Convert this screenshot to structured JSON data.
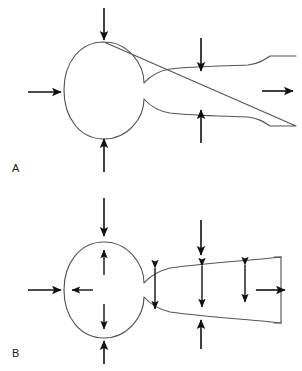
{
  "figure": {
    "background_color": "#ffffff",
    "outline_color": "#555555",
    "arrow_color": "#111111",
    "width": 302,
    "height": 371
  },
  "panels": [
    {
      "id": "A",
      "label": "A",
      "label_x": 12,
      "label_y": 172,
      "description": "Bulb and tapering tube with external compressive force arrows and axial flow arrows",
      "shape": {
        "name": "bulb-and-tube-outline-a",
        "bulb_center_x": 104,
        "bulb_center_y": 90,
        "bulb_radius_x": 40,
        "bulb_radius_y": 48,
        "tube_right_x": 296,
        "tube_top_y": 68,
        "tube_bottom_y": 112
      },
      "arrows": [
        {
          "name": "inflow-arrow-left",
          "kind": "single",
          "direction": "right",
          "x1": 28,
          "y1": 92,
          "x2": 64,
          "y2": 92
        },
        {
          "name": "outflow-arrow-right",
          "kind": "single",
          "direction": "right",
          "x1": 262,
          "y1": 91,
          "x2": 296,
          "y2": 91
        },
        {
          "name": "bulb-top-force-arrow",
          "kind": "single",
          "direction": "down",
          "x1": 104,
          "y1": 8,
          "x2": 104,
          "y2": 43
        },
        {
          "name": "bulb-bottom-force-arrow",
          "kind": "single",
          "direction": "up",
          "x1": 104,
          "y1": 172,
          "x2": 104,
          "y2": 136
        },
        {
          "name": "tube-top-force-arrow",
          "kind": "single",
          "direction": "down",
          "x1": 201,
          "y1": 38,
          "x2": 201,
          "y2": 74
        },
        {
          "name": "tube-bottom-force-arrow",
          "kind": "single",
          "direction": "up",
          "x1": 201,
          "y1": 143,
          "x2": 201,
          "y2": 106
        }
      ]
    },
    {
      "id": "B",
      "label": "B",
      "label_x": 12,
      "label_y": 357,
      "description": "Bulb and tube with external force arrows plus internal radially outward and double-headed distension arrows, closed bracket at outlet",
      "shape": {
        "name": "bulb-and-tube-outline-b",
        "bulb_center_x": 104,
        "bulb_center_y": 290,
        "bulb_radius_x": 40,
        "bulb_radius_y": 48,
        "tube_right_x": 281,
        "tube_top_y": 262,
        "tube_bottom_y": 312
      },
      "arrows": [
        {
          "name": "inflow-arrow-left",
          "kind": "single",
          "direction": "right",
          "x1": 28,
          "y1": 290,
          "x2": 64,
          "y2": 290
        },
        {
          "name": "outflow-arrow-right",
          "kind": "single",
          "direction": "right",
          "x1": 258,
          "y1": 290,
          "x2": 288,
          "y2": 290
        },
        {
          "name": "bulb-top-force-arrow",
          "kind": "single",
          "direction": "down",
          "x1": 104,
          "y1": 198,
          "x2": 104,
          "y2": 238
        },
        {
          "name": "bulb-bottom-force-arrow",
          "kind": "single",
          "direction": "up",
          "x1": 104,
          "y1": 357,
          "x2": 104,
          "y2": 333
        },
        {
          "name": "tube-top-force-arrow",
          "kind": "single",
          "direction": "down",
          "x1": 201,
          "y1": 220,
          "x2": 201,
          "y2": 258
        },
        {
          "name": "tube-bottom-force-arrow",
          "kind": "single",
          "direction": "up",
          "x1": 201,
          "y1": 345,
          "x2": 201,
          "y2": 317
        },
        {
          "name": "bulb-internal-up-arrow",
          "kind": "single",
          "direction": "up",
          "x1": 104,
          "y1": 273,
          "x2": 104,
          "y2": 248
        },
        {
          "name": "bulb-internal-down-arrow",
          "kind": "single",
          "direction": "down",
          "x1": 104,
          "y1": 306,
          "x2": 104,
          "y2": 330
        },
        {
          "name": "bulb-internal-left-arrow",
          "kind": "single",
          "direction": "left",
          "x1": 93,
          "y1": 290,
          "x2": 70,
          "y2": 290
        },
        {
          "name": "tube-distension-arrow-1",
          "kind": "double",
          "direction": "vertical",
          "x1": 155,
          "y1": 266,
          "x2": 155,
          "y2": 310
        },
        {
          "name": "tube-distension-arrow-2",
          "kind": "double",
          "direction": "vertical",
          "x1": 202,
          "y1": 264,
          "x2": 202,
          "y2": 308
        },
        {
          "name": "tube-distension-arrow-3",
          "kind": "double",
          "direction": "vertical",
          "x1": 245,
          "y1": 264,
          "x2": 245,
          "y2": 303
        }
      ]
    }
  ]
}
